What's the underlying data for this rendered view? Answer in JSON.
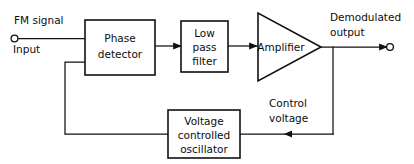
{
  "diagram": {
    "blocks": [
      {
        "id": "phase_detector",
        "lines": [
          "Phase",
          "detector"
        ]
      },
      {
        "id": "low_pass_filter",
        "lines": [
          "Low",
          "pass",
          "filter"
        ]
      },
      {
        "id": "amplifier",
        "lines": [
          "Amplifier"
        ]
      },
      {
        "id": "vco",
        "lines": [
          "Voltage",
          "controlled",
          "oscillator"
        ]
      }
    ],
    "labels": {
      "input_line1": "FM signal",
      "input_line2": "Input",
      "output_line1": "Demodulated",
      "output_line2": "output",
      "feedback_line1": "Control",
      "feedback_line2": "voltage"
    },
    "colors": {
      "background": "#ffffff",
      "ink": "#111111",
      "text": "#0d0d0d"
    }
  }
}
